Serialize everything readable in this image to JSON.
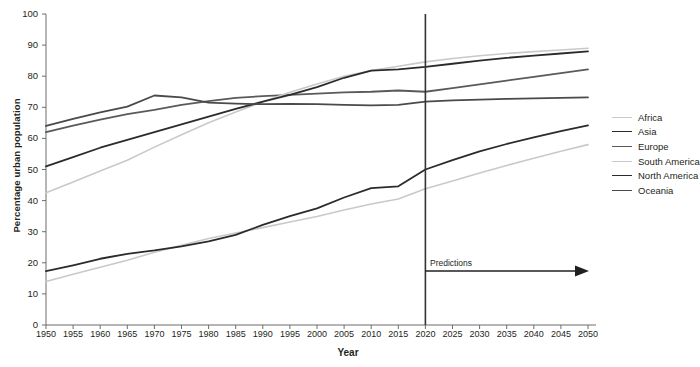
{
  "chart_data": {
    "type": "line",
    "title": "",
    "xlabel": "Year",
    "ylabel": "Percentage urban population",
    "xlim": [
      1950,
      2050
    ],
    "ylim": [
      0,
      100
    ],
    "ytick_step": 10,
    "xtick_step": 5,
    "grid": false,
    "legend_position": "right",
    "x": [
      1950,
      1955,
      1960,
      1965,
      1970,
      1975,
      1980,
      1985,
      1990,
      1995,
      2000,
      2005,
      2010,
      2015,
      2020,
      2025,
      2030,
      2035,
      2040,
      2045,
      2050
    ],
    "yticks": [
      "0",
      "10",
      "20",
      "30",
      "40",
      "50",
      "60",
      "70",
      "80",
      "90",
      "100"
    ],
    "xticks": [
      "1950",
      "1955",
      "1960",
      "1965",
      "1970",
      "1975",
      "1980",
      "1985",
      "1990",
      "1995",
      "2000",
      "2005",
      "2010",
      "2015",
      "2020",
      "2025",
      "2030",
      "2035",
      "2040",
      "2045",
      "2050"
    ],
    "series": [
      {
        "name": "Africa",
        "color": "#c9c9c9",
        "width": 1.6,
        "values": [
          14.0,
          16.3,
          18.6,
          20.8,
          23.4,
          25.6,
          27.8,
          29.6,
          31.3,
          33.1,
          34.9,
          37.0,
          38.9,
          40.5,
          43.8,
          46.3,
          48.9,
          51.3,
          53.6,
          55.9,
          58.0
        ]
      },
      {
        "name": "Asia",
        "color": "#2b2b2b",
        "width": 1.8,
        "values": [
          17.3,
          19.2,
          21.3,
          22.9,
          24.0,
          25.3,
          26.9,
          29.0,
          32.2,
          35.0,
          37.5,
          41.0,
          44.0,
          44.6,
          50.0,
          53.0,
          55.8,
          58.2,
          60.3,
          62.3,
          64.2
        ]
      },
      {
        "name": "Europe",
        "color": "#5a5a5a",
        "width": 1.8,
        "values": [
          62.0,
          64.1,
          66.0,
          67.8,
          69.2,
          70.8,
          72.0,
          73.0,
          73.6,
          74.0,
          74.4,
          74.8,
          75.0,
          75.4,
          75.0,
          76.2,
          77.4,
          78.6,
          79.8,
          81.0,
          82.2
        ]
      },
      {
        "name": "South America",
        "color": "#c9c9c9",
        "width": 1.6,
        "values": [
          42.5,
          46.0,
          49.5,
          53.0,
          57.2,
          61.2,
          65.0,
          68.5,
          71.8,
          74.8,
          77.5,
          80.0,
          81.8,
          83.2,
          84.6,
          85.7,
          86.6,
          87.3,
          87.9,
          88.4,
          89.0
        ]
      },
      {
        "name": "North America",
        "color": "#2b2b2b",
        "width": 1.8,
        "values": [
          51.0,
          54.0,
          57.0,
          59.5,
          62.0,
          64.5,
          67.0,
          69.5,
          71.8,
          74.0,
          76.5,
          79.5,
          81.8,
          82.2,
          83.0,
          84.0,
          85.0,
          85.9,
          86.6,
          87.3,
          88.0
        ]
      },
      {
        "name": "Oceania",
        "color": "#4a4a4a",
        "width": 1.8,
        "values": [
          64.0,
          66.3,
          68.4,
          70.2,
          73.8,
          73.2,
          71.5,
          71.2,
          71.0,
          71.1,
          71.0,
          70.8,
          70.6,
          70.8,
          71.8,
          72.2,
          72.5,
          72.7,
          72.9,
          73.0,
          73.2
        ]
      }
    ],
    "annotations": [
      {
        "name": "predictions",
        "text": "Predictions",
        "x": 2020,
        "arrow_to": 2050
      }
    ],
    "vertical_line": {
      "x": 2020,
      "color": "#333333"
    }
  }
}
